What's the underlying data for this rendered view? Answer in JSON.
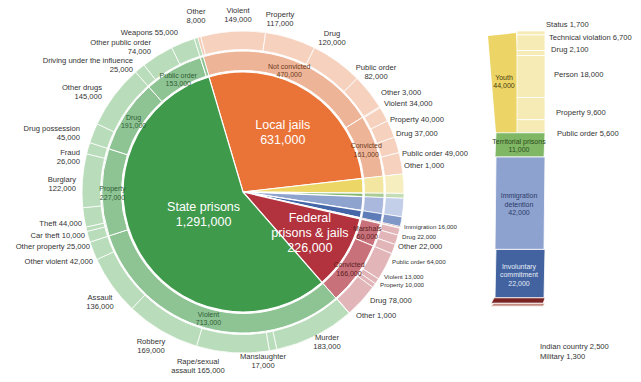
{
  "chart_data": {
    "type": "pie",
    "subtype": "sunburst-with-exploded-bar",
    "title": "",
    "unit": "people confined",
    "center": [
      243,
      192
    ],
    "radii": {
      "core": 120,
      "middle": 141,
      "outer": 161
    },
    "start_angle_deg": -16.5,
    "slices": [
      {
        "key": "local",
        "name": "Local jails",
        "value": 631000,
        "label": "Local jails",
        "value_label": "631,000",
        "color": "#ea7437",
        "middle": [
          {
            "name": "Not convicted",
            "value": 470000,
            "label": "Not convicted\n470,000",
            "color": "#eeb497",
            "outer": [
              {
                "name": "Other",
                "value": 8000,
                "label": "Other\n8,000",
                "color": "#f3cbb6"
              },
              {
                "name": "Violent",
                "value": 149000,
                "label": "Violent\n149,000",
                "color": "#f5d1be"
              },
              {
                "name": "Property",
                "value": 117000,
                "label": "Property\n117,000",
                "color": "#f5d1be"
              },
              {
                "name": "Drug",
                "value": 120000,
                "label": "Drug\n120,000",
                "color": "#f5d1be"
              },
              {
                "name": "Public order",
                "value": 82000,
                "label": "Public order\n82,000",
                "color": "#f5d1be"
              }
            ]
          },
          {
            "name": "Convicted",
            "value": 161000,
            "label": "Convicted\n161,000",
            "color": "#eeb497",
            "outer": [
              {
                "name": "Other",
                "value": 3000,
                "label": "Other 3,000",
                "color": "#f5d1be"
              },
              {
                "name": "Violent",
                "value": 34000,
                "label": "Violent 34,000",
                "color": "#f5d1be"
              },
              {
                "name": "Property",
                "value": 40000,
                "label": "Property 40,000",
                "color": "#f5d1be"
              },
              {
                "name": "Drug",
                "value": 37000,
                "label": "Drug 37,000",
                "color": "#f5d1be"
              },
              {
                "name": "Public order",
                "value": 49000,
                "label": "Public order 49,000",
                "color": "#f5d1be"
              }
            ]
          }
        ]
      },
      {
        "key": "youth",
        "name": "Youth",
        "value": 44000,
        "color": "#ecd766",
        "middle_color": "#f3e6a0",
        "outer_color": "#f7eec0"
      },
      {
        "key": "territorial",
        "name": "Territorial prisons",
        "value": 11000,
        "color": "#86b96c",
        "middle_color": "#a8cc94",
        "outer_color": "#c4ddb5"
      },
      {
        "key": "immigration",
        "name": "Immigration detention",
        "value": 42000,
        "color": "#8fa3cf",
        "middle_color": "#a9b8dc",
        "outer_color": "#c3cfe8"
      },
      {
        "key": "involuntary",
        "name": "Involuntary commitment",
        "value": 22000,
        "color": "#4466a8",
        "middle_color": "#5d7cb8",
        "outer_color": "#7f98c8"
      },
      {
        "key": "indian",
        "name": "Indian country",
        "value": 2500,
        "color": "#7b2a2a",
        "middle_color": "#8f3c3c",
        "outer_color": "#a35454"
      },
      {
        "key": "military",
        "name": "Military",
        "value": 1300,
        "color": "#c98a80",
        "middle_color": "#d6a39b",
        "outer_color": "#e3bdb7"
      },
      {
        "key": "federal",
        "name": "Federal prisons & jails",
        "value": 226000,
        "label": "Federal\nprisons & jails",
        "value_label": "226,000",
        "color": "#b2333d",
        "middle": [
          {
            "name": "Marshals",
            "value": 60000,
            "label": "Marshals\n60,000",
            "color": "#c9717a",
            "outer": [
              {
                "name": "Immigration",
                "value": 16000,
                "label": "Immigration 16,000",
                "color": "#e2b5b9"
              },
              {
                "name": "Drug",
                "value": 22000,
                "label": "Drug 22,000",
                "color": "#e2b5b9"
              },
              {
                "name": "Other",
                "value": 22000,
                "label": "Other 22,000",
                "color": "#e2b5b9"
              }
            ]
          },
          {
            "name": "Convicted",
            "value": 166000,
            "label": "Convicted\n166,000",
            "color": "#c9717a",
            "outer": [
              {
                "name": "Public order",
                "value": 64000,
                "label": "Public order 64,000",
                "color": "#e2b5b9"
              },
              {
                "name": "Violent",
                "value": 13000,
                "label": "Violent 13,000",
                "color": "#e2b5b9"
              },
              {
                "name": "Property",
                "value": 10000,
                "label": "Property 10,000",
                "color": "#e2b5b9"
              },
              {
                "name": "Drug",
                "value": 78000,
                "label": "Drug 78,000",
                "color": "#e2b5b9"
              },
              {
                "name": "Other",
                "value": 1000,
                "label": "Other 1,000",
                "color": "#e2b5b9"
              }
            ]
          }
        ]
      },
      {
        "key": "state",
        "name": "State prisons",
        "value": 1291000,
        "label": "State prisons",
        "value_label": "1,291,000",
        "color": "#3f9a4c",
        "middle": [
          {
            "name": "Violent",
            "value": 713000,
            "label": "Violent\n713,000",
            "color": "#8ec394",
            "outer": [
              {
                "name": "Murder",
                "value": 183000,
                "label": "Murder\n183,000",
                "color": "#b9dcba"
              },
              {
                "name": "Manslaughter",
                "value": 17000,
                "label": "Manslaughter\n17,000",
                "color": "#b9dcba"
              },
              {
                "name": "Rape/sexual assault",
                "value": 165000,
                "label": "Rape/sexual\nassault 165,000",
                "color": "#b9dcba"
              },
              {
                "name": "Robbery",
                "value": 169000,
                "label": "Robbery\n169,000",
                "color": "#b9dcba"
              },
              {
                "name": "Assault",
                "value": 136000,
                "label": "Assault\n136,000",
                "color": "#b9dcba"
              },
              {
                "name": "Other violent",
                "value": 42000,
                "label": "Other violent 42,000",
                "color": "#b9dcba"
              }
            ]
          },
          {
            "name": "Property",
            "value": 227000,
            "label": "Property\n227,000",
            "color": "#8ec394",
            "outer": [
              {
                "name": "Other property",
                "value": 25000,
                "label": "Other property 25,000",
                "color": "#b9dcba"
              },
              {
                "name": "Car theft",
                "value": 10000,
                "label": "Car theft 10,000",
                "color": "#b9dcba"
              },
              {
                "name": "Theft",
                "value": 44000,
                "label": "Theft 44,000",
                "color": "#b9dcba"
              },
              {
                "name": "Burglary",
                "value": 122000,
                "label": "Burglary\n122,000",
                "color": "#b9dcba"
              },
              {
                "name": "Fraud",
                "value": 26000,
                "label": "Fraud\n26,000",
                "color": "#b9dcba"
              }
            ]
          },
          {
            "name": "Drug",
            "value": 191000,
            "label": "Drug\n191,000",
            "color": "#8ec394",
            "outer": [
              {
                "name": "Drug possession",
                "value": 45000,
                "label": "Drug possession\n45,000",
                "color": "#b9dcba"
              },
              {
                "name": "Other drugs",
                "value": 145000,
                "label": "Other drugs\n145,000",
                "color": "#b9dcba"
              }
            ]
          },
          {
            "name": "Public order",
            "value": 153000,
            "label": "Public order\n153,000",
            "color": "#8ec394",
            "outer": [
              {
                "name": "Driving under the influence",
                "value": 25000,
                "label": "Driving under the influence\n25,000",
                "color": "#b9dcba"
              },
              {
                "name": "Other public order",
                "value": 74000,
                "label": "Other public order\n74,000",
                "color": "#b9dcba"
              },
              {
                "name": "Weapons",
                "value": 55000,
                "label": "Weapons 55,000",
                "color": "#b9dcba"
              }
            ]
          },
          {
            "name": "Other",
            "value": 8000,
            "label": "",
            "color": "#8ec394",
            "outer": [
              {
                "name": "Other",
                "value": 8000,
                "label": "",
                "color": "#b9dcba"
              }
            ]
          }
        ]
      }
    ],
    "side_bar": {
      "segments": [
        {
          "name": "Youth",
          "value": 44000,
          "label": "Youth\n44,000",
          "color": "#ecd566",
          "detail": [
            {
              "name": "Status",
              "value": 1700,
              "label": "Status 1,700"
            },
            {
              "name": "Technical violation",
              "value": 6700,
              "label": "Technical violation 6,700"
            },
            {
              "name": "Drug",
              "value": 2100,
              "label": "Drug 2,100"
            },
            {
              "name": "Person",
              "value": 18000,
              "label": "Person 18,000"
            },
            {
              "name": "Property",
              "value": 9600,
              "label": "Property 9,600"
            },
            {
              "name": "Public order",
              "value": 5600,
              "label": "Public order 5,600"
            }
          ],
          "detail_color": "#f6ebb4"
        },
        {
          "name": "Territorial prisons",
          "value": 11000,
          "label": "Territorial prisons\n11,000",
          "color": "#7fb765"
        },
        {
          "name": "Immigration detention",
          "value": 42000,
          "label": "Immigration\ndetention\n42,000",
          "color": "#8ea2d0"
        },
        {
          "name": "Involuntary commitment",
          "value": 22000,
          "label": "Involuntary\ncommitment\n22,000",
          "color": "#42639f"
        },
        {
          "name": "Indian country",
          "value": 2500,
          "label": "Indian country 2,500",
          "color": "#7b2323"
        },
        {
          "name": "Military",
          "value": 1300,
          "label": "Military 1,300",
          "color": "#c38a7f"
        }
      ]
    },
    "outer_label_positions": {
      "state": [
        [
          [
            491,
            112,
            "middle"
          ]
        ],
        [
          [
            463,
            120,
            "middle"
          ]
        ],
        [
          [
            430,
            107,
            "middle"
          ]
        ],
        [
          [
            373,
            73,
            "middle"
          ]
        ],
        [
          [
            395,
            47,
            "middle"
          ]
        ],
        [
          [
            390,
            80,
            "end"
          ]
        ],
        [
          [
            87,
            55,
            "end"
          ]
        ],
        [
          [
            83,
            64,
            "end"
          ]
        ],
        [
          [
            27,
            95,
            "end"
          ]
        ],
        [
          [
            43,
            115,
            "middle"
          ]
        ],
        [
          [
            40,
            135,
            "end"
          ]
        ],
        [
          [
            26,
            148,
            "middle"
          ]
        ],
        [
          [
            84,
            64,
            "middle"
          ]
        ]
      ]
    },
    "annotations": [
      {
        "text": "Other\n8,000",
        "x": 196,
        "y": 14
      },
      {
        "text": "Violent\n149,000",
        "x": 238,
        "y": 13
      },
      {
        "text": "Property\n117,000",
        "x": 280,
        "y": 17
      },
      {
        "text": "Drug\n120,000",
        "x": 332,
        "y": 36
      },
      {
        "text": "Public order\n82,000",
        "x": 376,
        "y": 70
      },
      {
        "text": "Other 3,000",
        "x": 381,
        "y": 95,
        "anchor": "start"
      },
      {
        "text": "Violent 34,000",
        "x": 384,
        "y": 106,
        "anchor": "start"
      },
      {
        "text": "Property 40,000",
        "x": 390,
        "y": 122,
        "anchor": "start"
      },
      {
        "text": "Drug 37,000",
        "x": 396,
        "y": 136,
        "anchor": "start"
      },
      {
        "text": "Public order 49,000",
        "x": 402,
        "y": 156,
        "anchor": "start"
      },
      {
        "text": "Other 1,000",
        "x": 404,
        "y": 168,
        "anchor": "start"
      },
      {
        "text": "Immigration 16,000",
        "x": 404,
        "y": 229,
        "anchor": "start",
        "small": true
      },
      {
        "text": "Drug 22,000",
        "x": 402,
        "y": 239,
        "anchor": "start",
        "small": true
      },
      {
        "text": "Other 22,000",
        "x": 398,
        "y": 249,
        "anchor": "start"
      },
      {
        "text": "Public order 64,000",
        "x": 392,
        "y": 264,
        "anchor": "start",
        "small": true
      },
      {
        "text": "Violent 13,000",
        "x": 384,
        "y": 279,
        "anchor": "start",
        "small": true
      },
      {
        "text": "Property 10,000",
        "x": 380,
        "y": 287,
        "anchor": "start",
        "small": true
      },
      {
        "text": "Drug 78,000",
        "x": 370,
        "y": 303,
        "anchor": "start"
      },
      {
        "text": "Other 1,000",
        "x": 356,
        "y": 318,
        "anchor": "start"
      },
      {
        "text": "Murder\n183,000",
        "x": 327,
        "y": 340
      },
      {
        "text": "Manslaughter\n17,000",
        "x": 263,
        "y": 359
      },
      {
        "text": "Rape/sexual\nassault 165,000",
        "x": 198,
        "y": 364
      },
      {
        "text": "Robbery\n169,000",
        "x": 151,
        "y": 344
      },
      {
        "text": "Assault\n136,000",
        "x": 100,
        "y": 300
      },
      {
        "text": "Other violent 42,000",
        "x": 93,
        "y": 264,
        "anchor": "end"
      },
      {
        "text": "Other property 25,000",
        "x": 90,
        "y": 249,
        "anchor": "end"
      },
      {
        "text": "Car theft 10,000",
        "x": 85,
        "y": 238,
        "anchor": "end"
      },
      {
        "text": "Theft 44,000",
        "x": 82,
        "y": 226,
        "anchor": "end"
      },
      {
        "text": "Burglary\n122,000",
        "x": 76,
        "y": 182,
        "anchor": "end"
      },
      {
        "text": "Drug possession\n45,000",
        "x": 80,
        "y": 131,
        "anchor": "end"
      },
      {
        "text": "Fraud\n26,000",
        "x": 80,
        "y": 155,
        "anchor": "end"
      },
      {
        "text": "Other drugs\n145,000",
        "x": 102,
        "y": 90,
        "anchor": "end"
      },
      {
        "text": "Driving under the influence\n25,000",
        "x": 133,
        "y": 63,
        "anchor": "end"
      },
      {
        "text": "Other public order\n74,000",
        "x": 151,
        "y": 45,
        "anchor": "end"
      },
      {
        "text": "Weapons 55,000",
        "x": 178,
        "y": 35,
        "anchor": "end"
      }
    ]
  }
}
